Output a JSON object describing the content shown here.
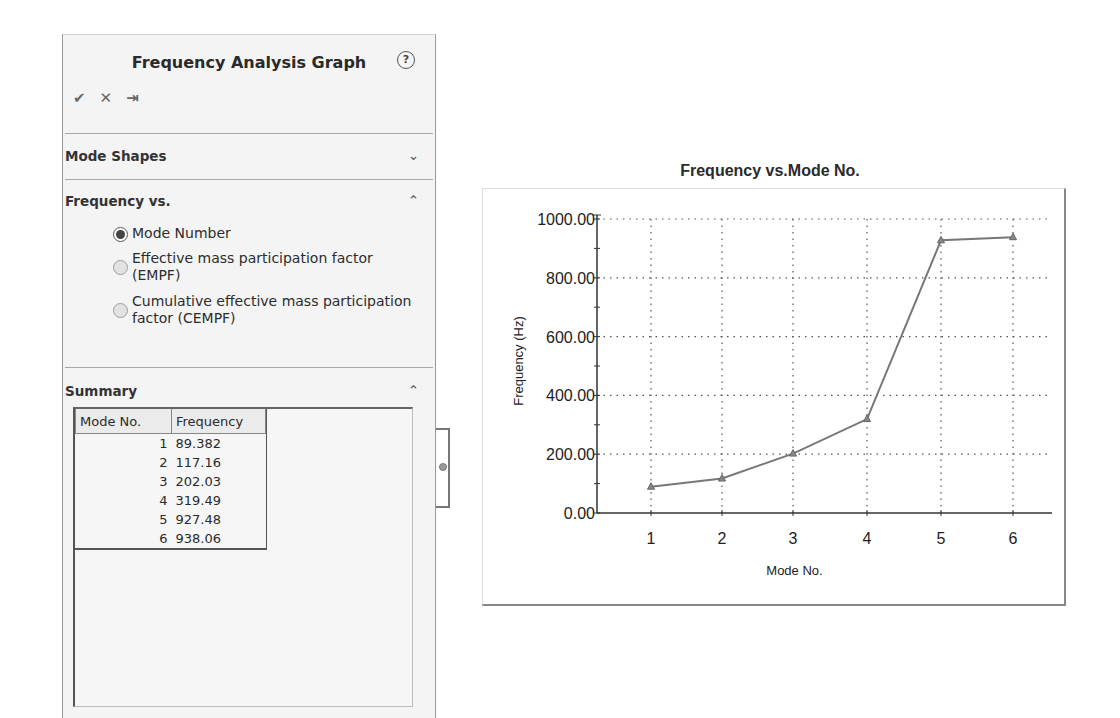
{
  "panel": {
    "title": "Frequency Analysis Graph",
    "help_icon": "?",
    "toolbar": [
      {
        "name": "ok-button",
        "icon": "✔"
      },
      {
        "name": "cancel-button",
        "icon": "✕"
      },
      {
        "name": "pin-button",
        "icon": "⇥"
      }
    ],
    "sections": {
      "mode_shapes": {
        "label": "Mode Shapes",
        "chevron": "⌄"
      },
      "frequency_vs": {
        "label": "Frequency vs.",
        "chevron": "⌃",
        "options": [
          {
            "label": "Mode Number",
            "selected": true
          },
          {
            "label": "Effective mass participation factor (EMPF)",
            "selected": false
          },
          {
            "label": "Cumulative effective mass participation factor (CEMPF)",
            "selected": false
          }
        ]
      },
      "summary": {
        "label": "Summary",
        "chevron": "⌃",
        "columns": [
          "Mode No.",
          "Frequency"
        ],
        "rows": [
          [
            "1",
            "89.382"
          ],
          [
            "2",
            "117.16"
          ],
          [
            "3",
            "202.03"
          ],
          [
            "4",
            "319.49"
          ],
          [
            "5",
            "927.48"
          ],
          [
            "6",
            "938.06"
          ]
        ]
      }
    }
  },
  "chart_data": {
    "type": "line",
    "title": "Frequency vs.Mode No.",
    "xlabel": "Mode No.",
    "ylabel": "Frequency (Hz)",
    "x": [
      1,
      2,
      3,
      4,
      5,
      6
    ],
    "categories": [
      "1",
      "2",
      "3",
      "4",
      "5",
      "6"
    ],
    "series": [
      {
        "name": "Frequency",
        "values": [
          89.382,
          117.16,
          202.03,
          319.49,
          927.48,
          938.06
        ],
        "color": "#777777",
        "marker": "triangle"
      }
    ],
    "ylim": [
      0,
      1000
    ],
    "yticks": [
      "0.00",
      "200.00",
      "400.00",
      "600.00",
      "800.00",
      "1000.00"
    ],
    "grid": true,
    "grid_style": "dotted",
    "legend": "none"
  }
}
